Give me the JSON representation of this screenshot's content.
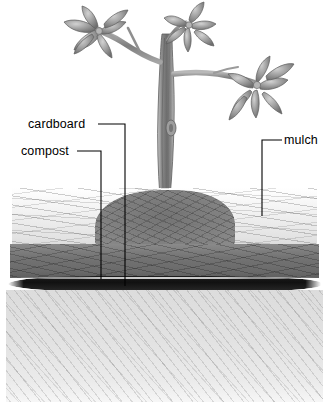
{
  "diagram": {
    "background_color": "#ffffff",
    "width": 327,
    "height": 416,
    "style": "pencil-illustration-grayscale"
  },
  "labels": {
    "cardboard": "cardboard",
    "compost": "compost",
    "mulch": "mulch"
  },
  "layers": [
    {
      "id": "mulch",
      "name": "mulch",
      "order": 1,
      "color": "#e3e3e3",
      "description": "top straw mulch layer"
    },
    {
      "id": "compost",
      "name": "compost",
      "order": 2,
      "color": "#737373",
      "description": "dark compost layer"
    },
    {
      "id": "cardboard",
      "name": "cardboard",
      "order": 3,
      "color": "#111111",
      "description": "thin cardboard sheet barrier"
    },
    {
      "id": "soil",
      "name": "soil",
      "order": 4,
      "color": "#e2e2e2",
      "description": "native soil beneath"
    }
  ],
  "tree": {
    "name": "young fruit tree",
    "trunk_color": "#8a8a8a",
    "leaf_color": "#9a9a9a",
    "branch_count": 3,
    "leaf_cluster_count": 3
  },
  "leaders": [
    {
      "label": "cardboard",
      "target_layer": "cardboard"
    },
    {
      "label": "compost",
      "target_layer": "compost"
    },
    {
      "label": "mulch",
      "target_layer": "mulch"
    }
  ]
}
